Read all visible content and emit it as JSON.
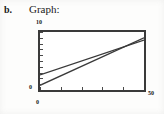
{
  "document": {
    "item_label": "b.",
    "heading": "Graph:"
  },
  "axes": {
    "y_max_label": "10",
    "y_min_label": "0",
    "x_min_label": "0",
    "x_max_label": "50"
  },
  "chart_data": {
    "type": "line",
    "title": "Graph:",
    "xlabel": "",
    "ylabel": "",
    "xlim": [
      0,
      50
    ],
    "ylim": [
      0,
      10
    ],
    "grid": false,
    "legend": "none",
    "x_ticks": [
      0,
      10,
      20,
      30,
      40,
      50
    ],
    "y_ticks": [
      0,
      1,
      2,
      3,
      4,
      5,
      6,
      7,
      8,
      9,
      10
    ],
    "x_tick_labels": [
      "0",
      "",
      "",
      "",
      "",
      "50"
    ],
    "y_tick_labels": [
      "0",
      "",
      "",
      "",
      "",
      "",
      "",
      "",
      "",
      "",
      "10"
    ],
    "series": [
      {
        "name": "line-upper",
        "x": [
          0,
          50
        ],
        "y": [
          2.6,
          8.6
        ],
        "color": "#3a3a3a",
        "style": "solid"
      },
      {
        "name": "line-lower",
        "x": [
          0,
          50
        ],
        "y": [
          0.8,
          9.0
        ],
        "color": "#3a3a3a",
        "style": "solid"
      }
    ],
    "annotations": [
      {
        "text": "lines intersect near x = 38",
        "x": 38,
        "y": 7.2
      }
    ]
  },
  "colors": {
    "ink": "#1a1a1a",
    "frame": "#3a3a3a",
    "line": "#3a3a3a",
    "paper": "#fdfdfc"
  }
}
